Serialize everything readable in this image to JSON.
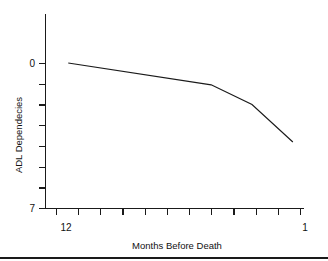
{
  "chart_data": {
    "type": "line",
    "title": "",
    "subtitle": "",
    "xlabel": "Months Before Death",
    "ylabel": "ADL Dependecies",
    "x_tick_labels": [
      "12",
      "",
      "",
      "",
      "",
      "",
      "",
      "",
      "",
      "",
      "",
      "1"
    ],
    "x_tick_values": [
      12,
      11,
      10,
      9,
      8,
      7,
      6,
      5,
      4,
      3,
      2,
      1
    ],
    "y_tick_labels": [
      "0",
      "",
      "",
      "",
      "",
      "",
      "",
      "7"
    ],
    "y_tick_values": [
      0,
      1,
      2,
      3,
      4,
      5,
      6,
      7
    ],
    "xlim": [
      12.6,
      0.6
    ],
    "ylim": [
      7,
      -0.4
    ],
    "grid": false,
    "legend": false,
    "legend_position": "none",
    "x_axis_inverted": true,
    "series": [
      {
        "name": "ADL dependencies before death",
        "x": [
          12,
          5,
          3,
          1
        ],
        "values": [
          0.0,
          1.05,
          2.0,
          3.8
        ]
      }
    ],
    "annotations": []
  },
  "axes": {
    "y_label_text": "ADL Dependecies",
    "y_top_label": "0",
    "y_bottom_label": "7",
    "x_left_label": "12",
    "x_right_label": "1",
    "x_label_text": "Months Before Death"
  },
  "colors": {
    "background": "#ffffff",
    "ink": "#1a1a1a",
    "line": "#1a1a1a"
  }
}
